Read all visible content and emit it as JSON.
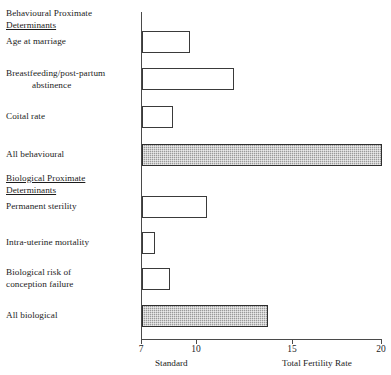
{
  "chart_data": {
    "type": "bar",
    "orientation": "horizontal",
    "title": "",
    "xlabel": "Total Fertility Rate",
    "ylabel": "",
    "xlim": [
      7,
      20
    ],
    "xticks": [
      7,
      10,
      15,
      20
    ],
    "xticklabels": [
      "7",
      "10",
      "15",
      "20"
    ],
    "grid": false,
    "legend": "none",
    "baseline_label": "Standard",
    "baseline_value": 7,
    "group_headings": [
      {
        "line1": "Behavioural Proximate",
        "line2": "Determinants",
        "underline": "line2"
      },
      {
        "line1": "Biological Proximate",
        "line2": "Determinants",
        "underline": "both"
      }
    ],
    "categories": [
      "Age at marriage",
      "Breastfeeding/post-partum abstinence",
      "Coital rate",
      "All behavioural",
      "Permanent sterility",
      "Intra-uterine mortality",
      "Biological risk of conception failure",
      "All biological"
    ],
    "values": [
      9.6,
      12.0,
      8.7,
      20.0,
      10.5,
      7.7,
      8.5,
      13.8
    ],
    "bars": [
      {
        "label_line1": "Age at marriage",
        "label_line2": "",
        "value": 9.6,
        "style": "open",
        "group": "behavioural"
      },
      {
        "label_line1": "Breastfeeding/post-partum",
        "label_line2": "abstinence",
        "value": 12.0,
        "style": "open",
        "group": "behavioural"
      },
      {
        "label_line1": "Coital rate",
        "label_line2": "",
        "value": 8.7,
        "style": "open",
        "group": "behavioural"
      },
      {
        "label_line1": "All behavioural",
        "label_line2": "",
        "value": 20.0,
        "style": "shaded",
        "group": "behavioural-total"
      },
      {
        "label_line1": "Permanent sterility",
        "label_line2": "",
        "value": 10.5,
        "style": "open",
        "group": "biological"
      },
      {
        "label_line1": "Intra-uterine mortality",
        "label_line2": "",
        "value": 7.7,
        "style": "open",
        "group": "biological"
      },
      {
        "label_line1": "Biological risk of",
        "label_line2": "conception failure",
        "value": 8.5,
        "style": "open",
        "group": "biological"
      },
      {
        "label_line1": "All biological",
        "label_line2": "",
        "value": 13.8,
        "style": "shaded",
        "group": "biological-total"
      }
    ]
  },
  "axis": {
    "tick_7": "7",
    "tick_10": "10",
    "tick_15": "15",
    "tick_20": "20",
    "caption_left": "Standard",
    "caption_right": "Total Fertility Rate"
  },
  "headings": {
    "behavioural_line1": "Behavioural Proximate",
    "behavioural_line2": "Determinants",
    "biological_line1": "Biological Proximate",
    "biological_line2": "Determinants"
  },
  "labels": {
    "age_at_marriage": "Age at marriage",
    "breastfeeding_l1": "Breastfeeding/post-partum",
    "breastfeeding_l2": "abstinence",
    "coital_rate": "Coital rate",
    "all_behavioural": "All behavioural",
    "permanent_sterility": "Permanent sterility",
    "intra_uterine_mortality": "Intra-uterine mortality",
    "biological_risk_l1": "Biological risk of",
    "biological_risk_l2": "conception failure",
    "all_biological": "All biological"
  },
  "colors": {
    "axis": "#4a4a4a",
    "bar_outline": "#3a3a3a",
    "bar_fill_open": "#ffffff",
    "bar_fill_shaded": "#9a9a9a",
    "text": "#1c1c1c"
  }
}
